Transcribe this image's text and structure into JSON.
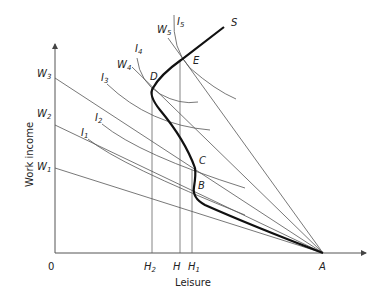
{
  "diagram": {
    "type": "economics labour supply diagram",
    "x_axis": {
      "label": "Leisure",
      "origin": "0",
      "ticks": [
        {
          "main": "H",
          "sub": "2"
        },
        {
          "main": "H",
          "sub": ""
        },
        {
          "main": "H",
          "sub": "1"
        }
      ],
      "end_point": "A"
    },
    "y_axis": {
      "label": "Work income",
      "ticks": [
        {
          "main": "W",
          "sub": "1"
        },
        {
          "main": "W",
          "sub": "2"
        },
        {
          "main": "W",
          "sub": "3"
        }
      ]
    },
    "budget_lines_labels": [
      {
        "main": "W",
        "sub": "4"
      },
      {
        "main": "W",
        "sub": "5"
      }
    ],
    "indifference_curves": [
      {
        "main": "I",
        "sub": "1"
      },
      {
        "main": "I",
        "sub": "2"
      },
      {
        "main": "I",
        "sub": "3"
      },
      {
        "main": "I",
        "sub": "4"
      },
      {
        "main": "I",
        "sub": "5"
      }
    ],
    "points": [
      "B",
      "C",
      "D",
      "E"
    ],
    "curve_label": "S"
  }
}
